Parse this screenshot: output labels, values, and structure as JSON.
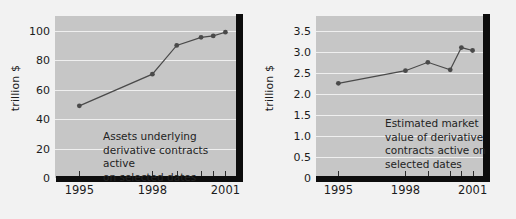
{
  "figure": {
    "background": "#f2f2f2",
    "plot_background": "#c6c6c6",
    "line_color": "#4a4a4a",
    "marker_color": "#4a4a4a",
    "axis_color": "#0d0d0d",
    "grid_color": "#efefef"
  },
  "chart_data": [
    {
      "type": "line",
      "title": "",
      "xlabel": "",
      "ylabel": "trillion $",
      "annotation": "Assets underlying\nderivative contracts active\non selected dates",
      "ylim": [
        0,
        110
      ],
      "xlim": [
        1994.0,
        2001.6
      ],
      "grid": true,
      "legend": "none",
      "ytick_labels": [
        "0",
        "20",
        "40",
        "60",
        "80",
        "100"
      ],
      "ytick_values": [
        0,
        20,
        40,
        60,
        80,
        100
      ],
      "xtick_labels": [
        "1995",
        "1998",
        "2001"
      ],
      "xtick_values": [
        1995,
        1998,
        2001
      ],
      "x_minor_ticks": [
        1995,
        1998,
        1999,
        2000,
        2000.5,
        2001
      ],
      "x": [
        1995,
        1998,
        1999,
        2000,
        2000.5,
        2001
      ],
      "values": [
        49,
        70.5,
        90,
        95.5,
        96.5,
        99
      ],
      "series": [
        {
          "name": "Assets underlying derivative contracts",
          "values": [
            49,
            70.5,
            90,
            95.5,
            96.5,
            99
          ]
        }
      ]
    },
    {
      "type": "line",
      "title": "",
      "xlabel": "",
      "ylabel": "trillion $",
      "annotation": "Estimated market\nvalue of derivative\ncontracts active on\nselected dates",
      "ylim": [
        0,
        3.85
      ],
      "xlim": [
        1994.0,
        2001.6
      ],
      "grid": true,
      "legend": "none",
      "ytick_labels": [
        "0",
        "0.5",
        "1.0",
        "1.5",
        "2.0",
        "2.5",
        "3.0",
        "3.5"
      ],
      "ytick_values": [
        0,
        0.5,
        1.0,
        1.5,
        2.0,
        2.5,
        3.0,
        3.5
      ],
      "xtick_labels": [
        "1995",
        "1998",
        "2001"
      ],
      "xtick_values": [
        1995,
        1998,
        2001
      ],
      "x_minor_ticks": [
        1995,
        1998,
        1999,
        2000,
        2000.5,
        2001
      ],
      "x": [
        1995,
        1998,
        1999,
        2000,
        2000.5,
        2001
      ],
      "values": [
        2.25,
        2.55,
        2.75,
        2.57,
        3.1,
        3.03
      ],
      "series": [
        {
          "name": "Estimated market value of derivative contracts",
          "values": [
            2.25,
            2.55,
            2.75,
            2.57,
            3.1,
            3.03
          ]
        }
      ]
    }
  ]
}
